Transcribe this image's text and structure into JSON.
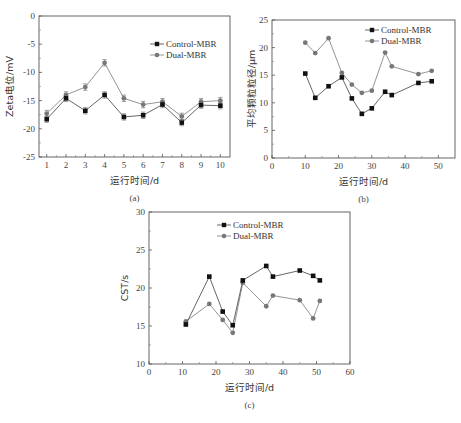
{
  "chart_data": [
    {
      "id": "a",
      "type": "line",
      "panel_label": "(a)",
      "title": "",
      "xlabel": "运行时间/d",
      "ylabel": "Zeta电位/mV",
      "xlim": [
        0.6,
        10.5
      ],
      "ylim": [
        -25,
        0
      ],
      "x_ticks": [
        1,
        2,
        3,
        4,
        5,
        6,
        7,
        8,
        9,
        10
      ],
      "y_ticks": [
        0,
        -5,
        -10,
        -15,
        -20,
        -25
      ],
      "grid": false,
      "error_bars": true,
      "legend_position": "upper right",
      "x": [
        1,
        2,
        3,
        4,
        5,
        6,
        7,
        8,
        9,
        10
      ],
      "series": [
        {
          "name": "Control-MBR",
          "marker": "square",
          "color": "#111111",
          "line_color": "#555555",
          "values": [
            -18.3,
            -14.6,
            -16.8,
            -14.0,
            -17.9,
            -17.6,
            -15.7,
            -18.9,
            -15.8,
            -15.9
          ]
        },
        {
          "name": "Dual-MBR",
          "marker": "circle",
          "color": "#777777",
          "line_color": "#888888",
          "values": [
            -17.3,
            -14.0,
            -12.6,
            -8.3,
            -14.6,
            -15.7,
            -15.2,
            -17.8,
            -15.2,
            -15.0
          ]
        }
      ]
    },
    {
      "id": "b",
      "type": "line",
      "panel_label": "(b)",
      "title": "",
      "xlabel": "运行时间/d",
      "ylabel": "平均颗粒粒径/μm",
      "xlim": [
        0,
        55
      ],
      "ylim": [
        0,
        25
      ],
      "x_ticks": [
        0,
        10,
        20,
        30,
        40,
        50
      ],
      "y_ticks": [
        0,
        5,
        10,
        15,
        20,
        25
      ],
      "grid": false,
      "legend_position": "upper right",
      "series": [
        {
          "name": "Control-MBR",
          "marker": "square",
          "color": "#111111",
          "line_color": "#555555",
          "x": [
            10,
            13,
            17,
            21,
            24,
            27,
            30,
            34,
            36,
            44,
            48
          ],
          "values": [
            15.3,
            10.9,
            13.0,
            14.6,
            10.8,
            8.0,
            9.0,
            12.0,
            11.4,
            13.6,
            13.9
          ]
        },
        {
          "name": "Dual-MBR",
          "marker": "circle",
          "color": "#777777",
          "line_color": "#888888",
          "x": [
            10,
            13,
            17,
            21,
            24,
            27,
            30,
            34,
            36,
            44,
            48
          ],
          "values": [
            20.9,
            19.0,
            21.7,
            15.4,
            13.3,
            11.8,
            12.2,
            19.1,
            16.6,
            15.2,
            15.8
          ]
        }
      ]
    },
    {
      "id": "c",
      "type": "line",
      "panel_label": "(c)",
      "title": "",
      "xlabel": "运行时间/d",
      "ylabel": "CST/s",
      "xlim": [
        0,
        60
      ],
      "ylim": [
        10,
        30
      ],
      "x_ticks": [
        0,
        10,
        20,
        30,
        40,
        50,
        60
      ],
      "y_ticks": [
        10,
        15,
        20,
        25,
        30
      ],
      "grid": false,
      "legend_position": "upper left-center",
      "series": [
        {
          "name": "Control-MBR",
          "marker": "square",
          "color": "#111111",
          "line_color": "#555555",
          "x": [
            11,
            18,
            22,
            25,
            28,
            35,
            37,
            45,
            49,
            51
          ],
          "values": [
            15.2,
            21.5,
            16.9,
            15.1,
            21.0,
            22.9,
            21.5,
            22.3,
            21.6,
            21.0
          ]
        },
        {
          "name": "Dual-MBR",
          "marker": "circle",
          "color": "#777777",
          "line_color": "#888888",
          "x": [
            11,
            18,
            22,
            25,
            28,
            35,
            37,
            45,
            49,
            51
          ],
          "values": [
            15.6,
            17.9,
            15.8,
            14.1,
            20.7,
            17.6,
            19.0,
            18.4,
            16.0,
            18.3
          ]
        }
      ]
    }
  ],
  "layout": {
    "a": {
      "left": 39,
      "right": 230,
      "top": 16,
      "bottom": 157,
      "xmin": 0.6,
      "xmax": 10.5
    },
    "b": {
      "left": 272,
      "right": 455,
      "top": 20,
      "bottom": 158
    },
    "c": {
      "left": 149,
      "right": 350,
      "top": 212,
      "bottom": 364
    }
  }
}
